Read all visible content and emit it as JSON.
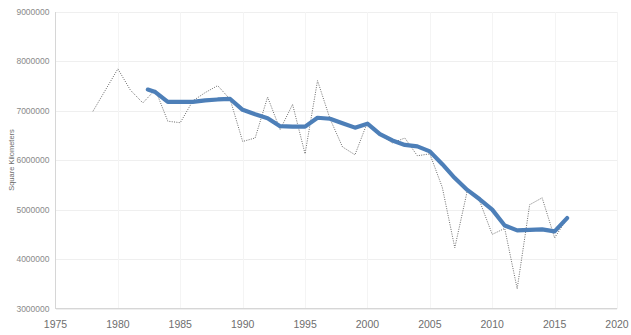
{
  "chart_data": {
    "type": "line",
    "title": "",
    "xlabel": "",
    "ylabel": "Square Kilometers",
    "xlim": [
      1975,
      2020
    ],
    "ylim": [
      3000000,
      9000000
    ],
    "grid": true,
    "legend": "none",
    "x_ticks": [
      "1975",
      "1980",
      "1985",
      "1990",
      "1995",
      "2000",
      "2005",
      "2010",
      "2015",
      "2020"
    ],
    "y_ticks": [
      "3000000",
      "4000000",
      "5000000",
      "6000000",
      "7000000",
      "8000000",
      "9000000"
    ],
    "series": [
      {
        "name": "Annual value",
        "style": "dotted",
        "color": "#5a5a5a",
        "x": [
          1978,
          1979,
          1980,
          1981,
          1982,
          1983,
          1984,
          1985,
          1986,
          1987,
          1988,
          1989,
          1990,
          1991,
          1992,
          1993,
          1994,
          1995,
          1996,
          1997,
          1998,
          1999,
          2000,
          2001,
          2002,
          2003,
          2004,
          2005,
          2006,
          2007,
          2008,
          2009,
          2010,
          2011,
          2012,
          2013,
          2014,
          2015,
          2016
        ],
        "values": [
          6990000,
          7420000,
          7850000,
          7420000,
          7160000,
          7430000,
          6790000,
          6760000,
          7200000,
          7370000,
          7510000,
          7230000,
          6380000,
          6450000,
          7280000,
          6620000,
          7130000,
          6130000,
          7610000,
          6840000,
          6270000,
          6110000,
          6770000,
          6520000,
          6350000,
          6450000,
          6090000,
          6130000,
          5450000,
          4230000,
          5380000,
          5170000,
          4500000,
          4620000,
          3400000,
          5100000,
          5240000,
          4430000,
          4820000
        ]
      },
      {
        "name": "Smoothed trend",
        "style": "solid-thick",
        "color": "#4d7fb8",
        "x": [
          1982.4,
          1983,
          1984,
          1985,
          1986,
          1987,
          1988,
          1989,
          1990,
          1991,
          1992,
          1993,
          1994,
          1995,
          1996,
          1997,
          1998,
          1999,
          2000,
          2001,
          2002,
          2003,
          2004,
          2005,
          2006,
          2007,
          2008,
          2009,
          2010,
          2011,
          2012,
          2013,
          2014,
          2015,
          2016
        ],
        "values": [
          7430000,
          7380000,
          7180000,
          7180000,
          7180000,
          7210000,
          7230000,
          7240000,
          7020000,
          6930000,
          6850000,
          6690000,
          6680000,
          6680000,
          6860000,
          6840000,
          6750000,
          6660000,
          6740000,
          6530000,
          6400000,
          6310000,
          6280000,
          6180000,
          5920000,
          5640000,
          5400000,
          5210000,
          5000000,
          4680000,
          4580000,
          4590000,
          4600000,
          4560000,
          4830000
        ]
      }
    ]
  },
  "axes": {
    "y_title": "Square Kilometers"
  }
}
